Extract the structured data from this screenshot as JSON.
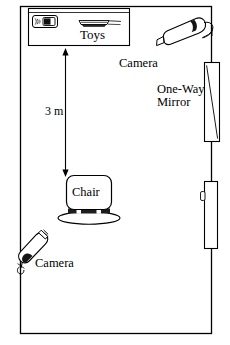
{
  "diagram": {
    "room": {
      "name": "room-outline",
      "left": 20,
      "top": 6,
      "right": 212,
      "bottom": 334
    },
    "toy_box": {
      "label": "Toys",
      "objects": [
        {
          "name": "toy-handheld-device"
        },
        {
          "name": "toy-flat-object"
        }
      ]
    },
    "cameras": [
      {
        "id": "camera-top-right",
        "label": "Camera"
      },
      {
        "id": "camera-bottom-left",
        "label": "Camera"
      }
    ],
    "mirror": {
      "label_line1": "One-Way",
      "label_line2": "Mirror"
    },
    "chair": {
      "label": "Chair"
    },
    "distance": {
      "label": "3 m",
      "from": "Toys",
      "to": "Chair"
    },
    "door": {
      "name": "door-right-wall"
    },
    "colors": {
      "line": "#000000",
      "fill": "#ffffff",
      "text": "#000000",
      "dark": "#1a1a1a"
    }
  }
}
